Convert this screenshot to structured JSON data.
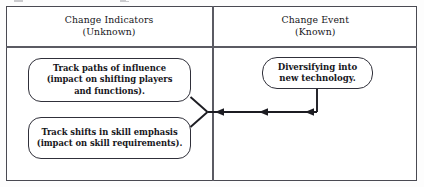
{
  "diagram": {
    "columns": [
      {
        "id": "change-indicators",
        "heading_line1": "Change Indicators",
        "heading_line2": "(Unknown)"
      },
      {
        "id": "change-event",
        "heading_line1": "Change Event",
        "heading_line2": "(Known)"
      }
    ],
    "nodes": [
      {
        "id": "track-paths-of-influence",
        "column": "change-indicators",
        "lines": [
          "Track paths of influence",
          "(impact on shifting players",
          "and functions)."
        ]
      },
      {
        "id": "track-shifts-in-skill-emphasis",
        "column": "change-indicators",
        "lines": [
          "Track shifts in skill emphasis",
          "(impact on skill requirements)."
        ]
      },
      {
        "id": "diversifying-into-new-technology",
        "column": "change-event",
        "lines": [
          "Diversifying into",
          "new technology."
        ]
      }
    ],
    "connectors": [
      {
        "id": "event-to-indicators-arrow",
        "from": "diversifying-into-new-technology",
        "to": "change-indicators-junction",
        "direction": "right-to-left",
        "arrowhead_count": 3
      },
      {
        "id": "junction-to-paths-branch",
        "from": "change-indicators-junction",
        "to": "track-paths-of-influence",
        "direction": "diagonal-up-left",
        "arrowhead_count": 0
      },
      {
        "id": "junction-to-skills-branch",
        "from": "change-indicators-junction",
        "to": "track-shifts-in-skill-emphasis",
        "direction": "diagonal-down-left",
        "arrowhead_count": 0
      }
    ],
    "colors": {
      "frame_border": "#4a4a52",
      "divider": "#5b5b63",
      "node_border": "#30303a",
      "connector": "#1c1c22",
      "background": "#ffffff",
      "text": "#16161a"
    }
  }
}
